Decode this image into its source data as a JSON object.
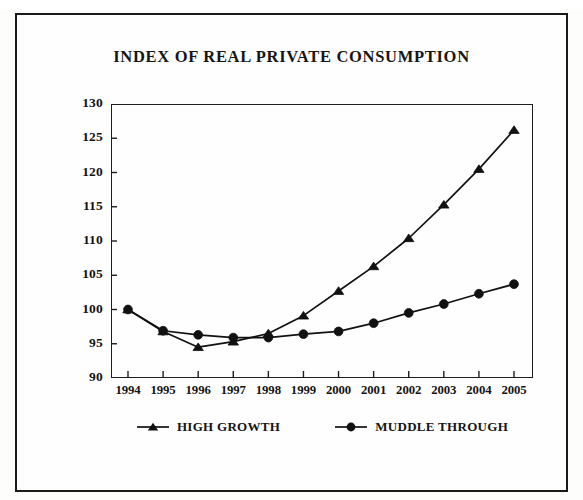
{
  "figure": {
    "title": "INDEX OF REAL PRIVATE CONSUMPTION"
  },
  "legend": {
    "items": [
      {
        "label": "HIGH GROWTH",
        "marker": "triangle-marker-icon",
        "color": "#111111"
      },
      {
        "label": "MUDDLE THROUGH",
        "marker": "circle-marker-icon",
        "color": "#111111"
      }
    ]
  },
  "axes": {
    "y_ticks": [
      "130",
      "125",
      "120",
      "115",
      "110",
      "105",
      "100",
      "95",
      "90"
    ],
    "x_ticks": [
      "1994",
      "1995",
      "1996",
      "1997",
      "1998",
      "1999",
      "2000",
      "2001",
      "2002",
      "2003",
      "2004",
      "2005"
    ]
  },
  "chart_data": {
    "type": "line",
    "title": "INDEX OF REAL PRIVATE CONSUMPTION",
    "xlabel": "",
    "ylabel": "",
    "x": [
      1994,
      1995,
      1996,
      1997,
      1998,
      1999,
      2000,
      2001,
      2002,
      2003,
      2004,
      2005
    ],
    "categories": [
      "1994",
      "1995",
      "1996",
      "1997",
      "1998",
      "1999",
      "2000",
      "2001",
      "2002",
      "2003",
      "2004",
      "2005"
    ],
    "series": [
      {
        "name": "HIGH GROWTH",
        "marker": "triangle",
        "color": "#111111",
        "values": [
          100.0,
          96.8,
          94.5,
          95.3,
          96.5,
          99.1,
          102.7,
          106.3,
          110.4,
          115.3,
          120.5,
          126.2
        ]
      },
      {
        "name": "MUDDLE THROUGH",
        "marker": "circle",
        "color": "#111111",
        "values": [
          100.0,
          96.9,
          96.3,
          95.9,
          95.9,
          96.4,
          96.8,
          98.0,
          99.5,
          100.8,
          102.3,
          103.7
        ]
      }
    ],
    "ylim": [
      90,
      130
    ],
    "ytick_step": 5,
    "xlim": [
      1994,
      2005
    ],
    "grid": false,
    "legend_position": "bottom"
  }
}
